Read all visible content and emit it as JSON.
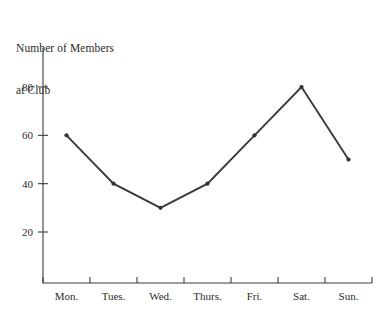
{
  "chart_data": {
    "type": "line",
    "title": "Number of Members at Club",
    "title_lines": [
      "Number of Members",
      "at Club"
    ],
    "categories": [
      "Mon.",
      "Tues.",
      "Wed.",
      "Thurs.",
      "Fri.",
      "Sat.",
      "Sun."
    ],
    "values": [
      60,
      40,
      30,
      40,
      60,
      80,
      50
    ],
    "xlabel": "",
    "ylabel": "",
    "ylim": [
      0,
      90
    ],
    "yticks": [
      20,
      40,
      60,
      80
    ],
    "ytick_labels": [
      "20",
      "40",
      "60",
      "80"
    ],
    "grid": false,
    "legend": false,
    "markers": true,
    "line_color": "#3a3a3a",
    "marker_color": "#333333",
    "axis_color": "#3c3c3c",
    "background_color": "#ffffff",
    "points": [
      {
        "category": "Mon.",
        "value": 60
      },
      {
        "category": "Tues.",
        "value": 40
      },
      {
        "category": "Wed.",
        "value": 30
      },
      {
        "category": "Thurs.",
        "value": 40
      },
      {
        "category": "Fri.",
        "value": 60
      },
      {
        "category": "Sat.",
        "value": 80
      },
      {
        "category": "Sun.",
        "value": 50
      }
    ]
  }
}
